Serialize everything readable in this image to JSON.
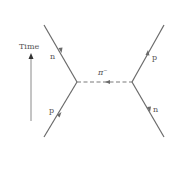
{
  "diagram": {
    "type": "feynman-diagram",
    "time_axis": {
      "label": "Time",
      "direction": "up"
    },
    "exchange_particle": {
      "label": "π",
      "charge": "−",
      "arrow_direction": "left"
    },
    "left_vertex": {
      "incoming": {
        "label": "p",
        "position": "lower-left"
      },
      "outgoing": {
        "label": "n",
        "position": "upper-left"
      }
    },
    "right_vertex": {
      "incoming": {
        "label": "n",
        "position": "lower-right"
      },
      "outgoing": {
        "label": "p",
        "position": "upper-right"
      }
    },
    "colors": {
      "line": "#6a6a6a",
      "text": "#555555",
      "background": "#ffffff"
    }
  }
}
